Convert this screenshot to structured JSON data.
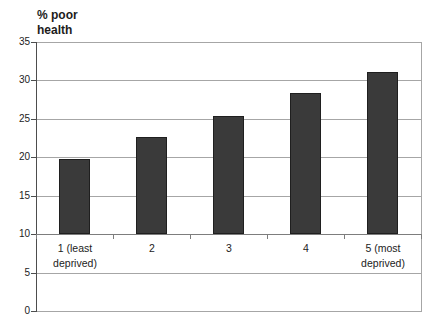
{
  "chart_data": {
    "type": "bar",
    "title": "% poor health",
    "ylabel": "% poor health",
    "xlabel": "",
    "categories": [
      "1 (least deprived)",
      "2",
      "3",
      "4",
      "5 (most deprived)"
    ],
    "values": [
      19.8,
      22.6,
      25.4,
      28.3,
      31.1
    ],
    "series_name": "% poor health",
    "ylim": [
      0,
      35
    ],
    "ytick_interval": 5,
    "yticks": [
      35,
      30,
      25,
      20,
      15,
      10,
      5,
      0
    ],
    "category_axis_crosses_at": 10,
    "grid": true,
    "legend": "none",
    "colors": {
      "bar_fill": "#3a3a3a",
      "bar_border": "#1f1f1f",
      "gridline": "#a6a6a6",
      "plot_border": "#a6a6a6",
      "value_axis": "#4d4d4d",
      "category_axis": "#7d7d7d",
      "text": "#1c1c1c",
      "background": "#ffffff"
    }
  }
}
